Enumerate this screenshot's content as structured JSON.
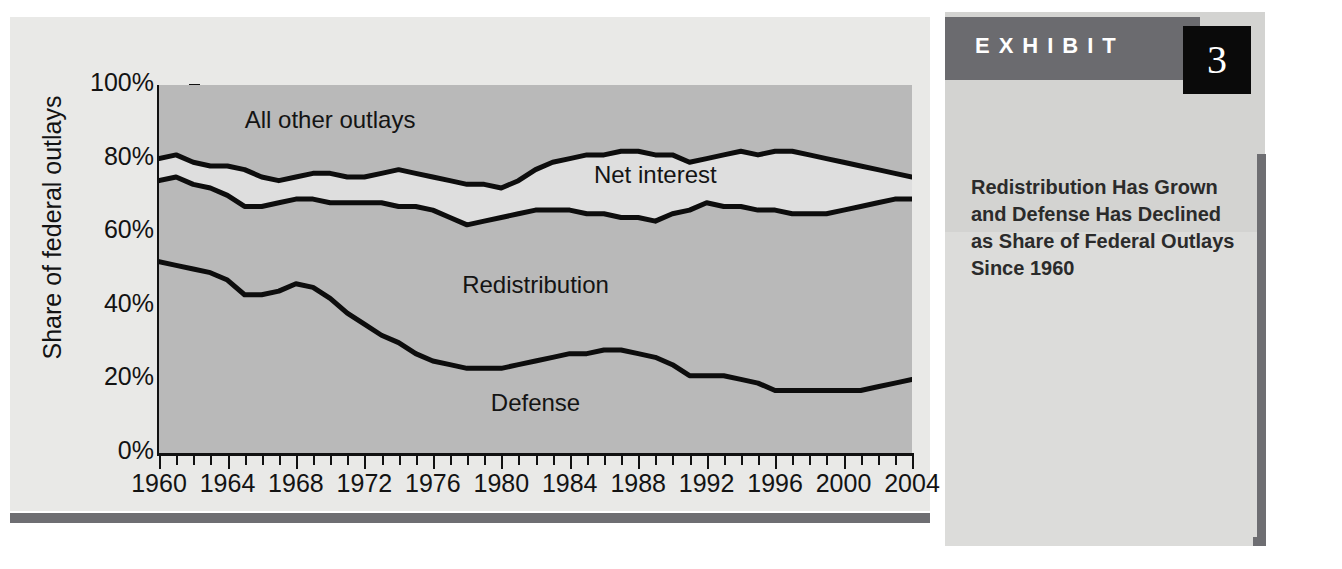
{
  "exhibit": {
    "word": "EXHIBIT",
    "number": "3",
    "caption": "Redistribution Has Grown and Defense Has Declined as Share of Federal Outlays Since 1960"
  },
  "chart_data": {
    "type": "area",
    "title": "",
    "xlabel": "",
    "ylabel": "Share of federal outlays",
    "xlim": [
      1960,
      2004
    ],
    "ylim": [
      0,
      100
    ],
    "grid": false,
    "legend_position": "in-plot",
    "y_tick_labels": [
      "0%",
      "20%",
      "40%",
      "60%",
      "80%",
      "100%"
    ],
    "y_tick_values": [
      0,
      20,
      40,
      60,
      80,
      100
    ],
    "x_tick_labels": [
      "1960",
      "1964",
      "1968",
      "1972",
      "1976",
      "1980",
      "1984",
      "1988",
      "1992",
      "1996",
      "2000",
      "2004"
    ],
    "x_tick_values": [
      1960,
      1964,
      1968,
      1972,
      1976,
      1980,
      1984,
      1988,
      1992,
      1996,
      2000,
      2004
    ],
    "x_minor_tick_step": 1,
    "annotations": [
      {
        "text": "All other outlays",
        "x": 1970,
        "y": 90
      },
      {
        "text": "Net interest",
        "x": 1989,
        "y": 75
      },
      {
        "text": "Redistribution",
        "x": 1982,
        "y": 45
      },
      {
        "text": "Defense",
        "x": 1982,
        "y": 13
      }
    ],
    "x": [
      1960,
      1961,
      1962,
      1963,
      1964,
      1965,
      1966,
      1967,
      1968,
      1969,
      1970,
      1971,
      1972,
      1973,
      1974,
      1975,
      1976,
      1977,
      1978,
      1979,
      1980,
      1981,
      1982,
      1983,
      1984,
      1985,
      1986,
      1987,
      1988,
      1989,
      1990,
      1991,
      1992,
      1993,
      1994,
      1995,
      1996,
      1997,
      1998,
      1999,
      2000,
      2001,
      2002,
      2003,
      2004
    ],
    "series": [
      {
        "name": "Defense",
        "description": "Cumulative boundary: defense share of federal outlays",
        "values": [
          52,
          51,
          50,
          49,
          47,
          43,
          43,
          44,
          46,
          45,
          42,
          38,
          35,
          32,
          30,
          27,
          25,
          24,
          23,
          23,
          23,
          24,
          25,
          26,
          27,
          27,
          28,
          28,
          27,
          26,
          24,
          21,
          21,
          21,
          20,
          19,
          17,
          17,
          17,
          17,
          17,
          17,
          18,
          19,
          20
        ]
      },
      {
        "name": "Redistribution",
        "description": "Cumulative boundary: defense + redistribution",
        "values": [
          74,
          75,
          73,
          72,
          70,
          67,
          67,
          68,
          69,
          69,
          68,
          68,
          68,
          68,
          67,
          67,
          66,
          64,
          62,
          63,
          64,
          65,
          66,
          66,
          66,
          65,
          65,
          64,
          64,
          63,
          65,
          66,
          68,
          67,
          67,
          66,
          66,
          65,
          65,
          65,
          66,
          67,
          68,
          69,
          69
        ]
      },
      {
        "name": "Net interest",
        "description": "Cumulative boundary: defense + redistribution + net interest",
        "values": [
          80,
          81,
          79,
          78,
          78,
          77,
          75,
          74,
          75,
          76,
          76,
          75,
          75,
          76,
          77,
          76,
          75,
          74,
          73,
          73,
          72,
          74,
          77,
          79,
          80,
          81,
          81,
          82,
          82,
          81,
          81,
          79,
          80,
          81,
          82,
          81,
          82,
          82,
          81,
          80,
          79,
          78,
          77,
          76,
          75
        ]
      },
      {
        "name": "All other outlays",
        "description": "Remaining share up to 100%",
        "values": [
          20,
          19,
          21,
          22,
          22,
          23,
          25,
          26,
          25,
          24,
          24,
          25,
          25,
          24,
          23,
          24,
          25,
          26,
          27,
          27,
          28,
          26,
          23,
          21,
          20,
          19,
          19,
          18,
          18,
          19,
          19,
          21,
          20,
          19,
          18,
          19,
          18,
          18,
          19,
          20,
          21,
          22,
          23,
          24,
          25
        ]
      }
    ],
    "colors": {
      "band_filled": "#b9b9b9",
      "band_net_interest": "#dedede",
      "line": "#0d0d0d",
      "panel": "#e9e9e7"
    }
  }
}
